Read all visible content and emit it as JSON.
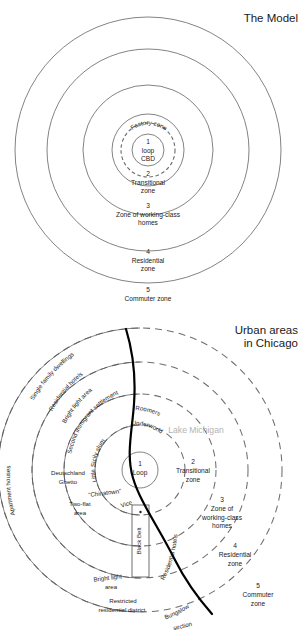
{
  "figures": [
    {
      "id": "model",
      "title": "The Model",
      "center_label": {
        "number": "1",
        "line1": "loop",
        "line2": "CBD"
      },
      "factory_zone_label": "Factory zone",
      "zones": [
        {
          "number": "2",
          "lines": [
            "Transitional",
            "zone"
          ]
        },
        {
          "number": "3",
          "lines": [
            "Zone of working-class",
            "homes"
          ]
        },
        {
          "number": "4",
          "lines": [
            "Residential",
            "zone"
          ]
        },
        {
          "number": "5",
          "lines": [
            "Commuter zone"
          ]
        }
      ]
    },
    {
      "id": "chicago",
      "title_lines": [
        "Urban areas",
        "in Chicago"
      ],
      "center_label": {
        "number": "1",
        "line1": "Loop"
      },
      "lake_label": "Lake Michigan",
      "black_belt_label": "Black Belt",
      "zones": [
        {
          "number": "2",
          "lines": [
            "Transitional",
            "zone"
          ]
        },
        {
          "number": "3",
          "lines": [
            "Zone of",
            "working-class",
            "homes"
          ]
        },
        {
          "number": "4",
          "lines": [
            "Residential",
            "zone"
          ]
        },
        {
          "number": "5",
          "lines": [
            "Commuter",
            "zone"
          ]
        }
      ],
      "district_labels": [
        "Single family dwellings",
        "Residential hotels",
        "Bright light area",
        "Second immigrant settlement",
        "Apartment houses",
        "Deutschland",
        "Ghetto",
        "Little Sicily slum",
        "Underworld",
        "Roomers",
        "“Chinatown”",
        "Vice",
        "Two-flat area",
        "Bright light area",
        "Residential hotels",
        "Restricted residential district",
        "Bungalow section"
      ]
    }
  ],
  "colors": {
    "ink": "#1a1a1a",
    "ring": "#5a5a5a",
    "dashed_ring": "#6e6e6e",
    "shoreline": "#000000",
    "lake_text": "#b3b3b3"
  }
}
